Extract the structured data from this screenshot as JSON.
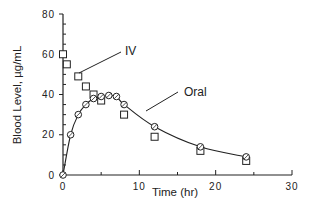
{
  "chart_data": {
    "type": "scatter",
    "title": "",
    "xlabel": "Time (hr)",
    "ylabel": "Blood Level, µg/mL",
    "xlim": [
      0,
      30
    ],
    "ylim": [
      0,
      80
    ],
    "x_ticks": [
      0,
      10,
      20,
      30
    ],
    "y_ticks": [
      0,
      20,
      40,
      60,
      80
    ],
    "grid": false,
    "legend": "none (direct annotations)",
    "annotations": [
      "IV",
      "Oral"
    ],
    "series": [
      {
        "name": "IV",
        "marker": "square",
        "line": false,
        "x": [
          0,
          0.5,
          2,
          3,
          4,
          5,
          8,
          12,
          18,
          24
        ],
        "values": [
          60,
          55,
          49,
          44,
          40,
          37,
          30,
          19,
          12,
          7
        ]
      },
      {
        "name": "Oral",
        "marker": "circle",
        "line": true,
        "x": [
          0,
          1,
          2,
          3,
          4,
          5,
          6,
          7,
          8,
          12,
          18,
          24
        ],
        "values": [
          0,
          20,
          30,
          35,
          38,
          39,
          39.5,
          39,
          35,
          24,
          14,
          9
        ]
      }
    ]
  },
  "labels": {
    "x_axis": "Time (hr)",
    "y_axis": "Blood Level, µg/mL",
    "iv": "IV",
    "oral": "Oral",
    "x_ticks": [
      "0",
      "10",
      "20",
      "30"
    ],
    "y_ticks": [
      "0",
      "20",
      "40",
      "60",
      "80"
    ]
  }
}
